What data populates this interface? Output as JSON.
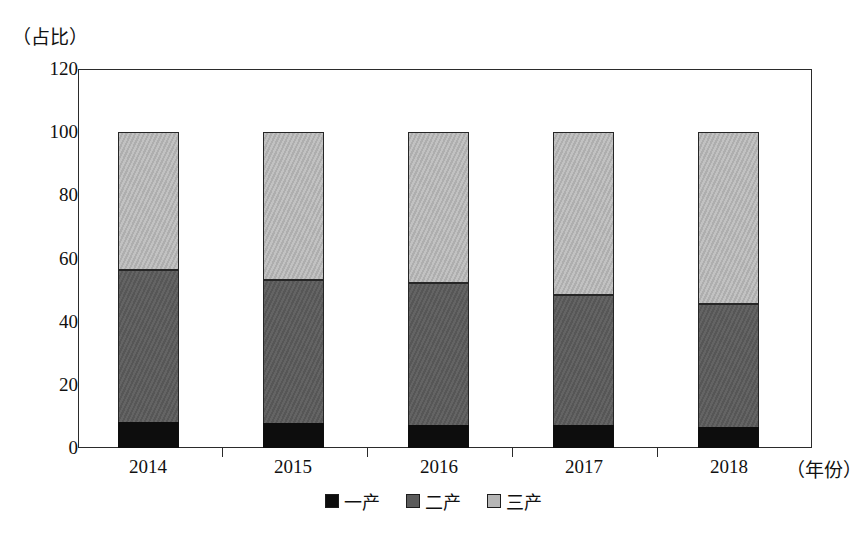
{
  "chart_data": {
    "type": "bar",
    "subtype": "stacked-bar-100",
    "title": "",
    "xlabel": "（年份）",
    "ylabel": "（占比）",
    "ylim": [
      0,
      120
    ],
    "yticks": [
      0,
      20,
      40,
      60,
      80,
      100,
      120
    ],
    "grid": false,
    "legend_position": "bottom-center",
    "categories": [
      "2014",
      "2015",
      "2016",
      "2017",
      "2018"
    ],
    "series": [
      {
        "name": "一产",
        "color": "#0d0d0d",
        "values": [
          8.2,
          7.9,
          7.3,
          7.3,
          6.7
        ]
      },
      {
        "name": "二产",
        "color": "#5b5b5b",
        "values": [
          48.3,
          45.3,
          44.9,
          41.3,
          38.9
        ]
      },
      {
        "name": "三产",
        "color": "#b6b6b6",
        "values": [
          43.5,
          46.8,
          47.8,
          51.4,
          54.4
        ]
      }
    ],
    "stack_tops": {
      "primary": [
        8.2,
        7.9,
        7.3,
        7.3,
        6.7
      ],
      "primary_plus_secondary": [
        56.5,
        53.2,
        52.2,
        48.6,
        45.6
      ],
      "total": [
        100,
        100,
        100,
        100,
        100
      ]
    },
    "annotations": []
  },
  "axes": {
    "y_unit_caption": "（占比）",
    "x_unit_caption": "（年份）",
    "y_tick_labels": [
      "120",
      "100",
      "80",
      "60",
      "40",
      "20",
      "0"
    ],
    "x_tick_labels": [
      "2014",
      "2015",
      "2016",
      "2017",
      "2018"
    ]
  },
  "legend": {
    "items": [
      {
        "label": "一产",
        "color": "#0d0d0d"
      },
      {
        "label": "二产",
        "color": "#5b5b5b"
      },
      {
        "label": "三产",
        "color": "#b6b6b6"
      }
    ]
  }
}
